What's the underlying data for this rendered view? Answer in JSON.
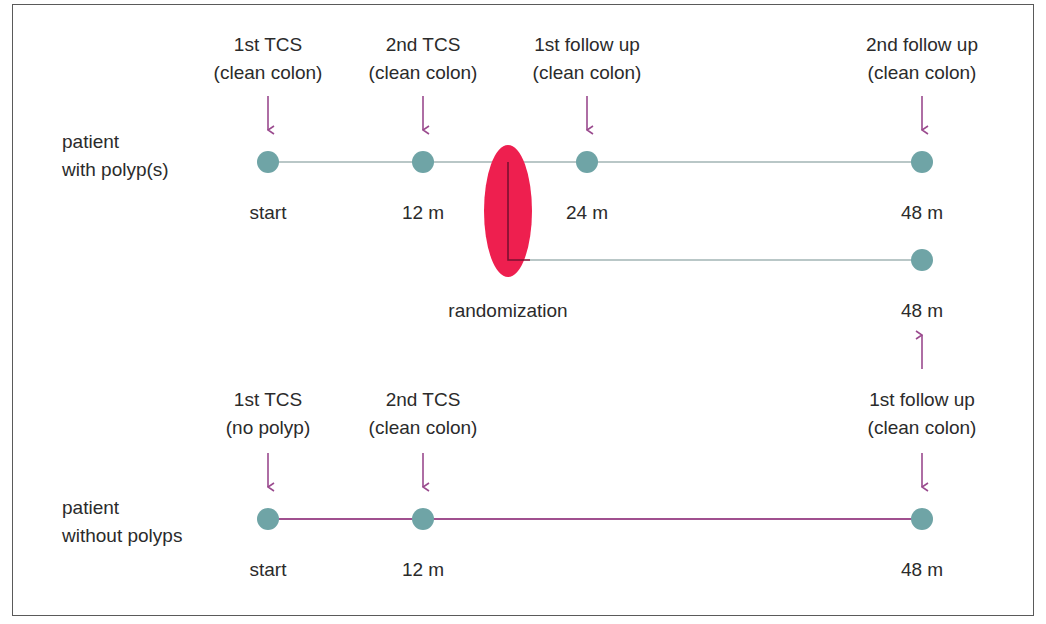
{
  "colors": {
    "node": "#6fa4a6",
    "timeline_with_polyps": "#b9c7c7",
    "timeline_without_polyps": "#a0508f",
    "arrow": "#9a4a8e",
    "randomization_ellipse": "#ee1f4f",
    "randomization_bracket": "#7a1030",
    "text": "#2b2b2b",
    "frame": "#5a5a5a"
  },
  "row_with_polyps": {
    "label_line1": "patient",
    "label_line2": "with polyp(s)",
    "events": [
      {
        "title": "1st TCS",
        "note": "(clean colon)",
        "time": "start"
      },
      {
        "title": "2nd TCS",
        "note": "(clean colon)",
        "time": "12 m"
      },
      {
        "title": "1st follow up",
        "note": "(clean colon)",
        "time": "24 m"
      },
      {
        "title": "2nd follow up",
        "note": "(clean colon)",
        "time": "48 m"
      }
    ]
  },
  "randomization": {
    "label": "randomization",
    "branch_end_time": "48 m"
  },
  "row_without_polyps": {
    "label_line1": "patient",
    "label_line2": "without polyps",
    "events": [
      {
        "title": "1st TCS",
        "note": "(no polyp)",
        "time": "start"
      },
      {
        "title": "2nd TCS",
        "note": "(clean colon)",
        "time": "12 m"
      },
      {
        "title": "1st follow up",
        "note": "(clean colon)",
        "time": "48 m"
      }
    ]
  }
}
